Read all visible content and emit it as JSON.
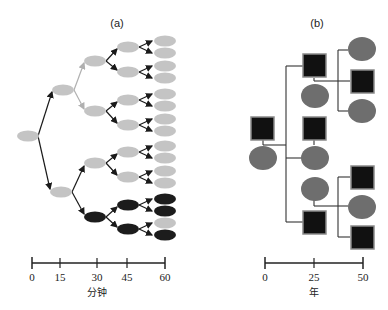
{
  "panel_a": {
    "label": "(a)",
    "axis": {
      "ticks": [
        "0",
        "15",
        "30",
        "45",
        "60"
      ],
      "unit": "分钟"
    },
    "colors": {
      "light": "#c4c4c4",
      "dark": "#1c1c1c",
      "arrow_dark": "#1a1a1a",
      "arrow_light": "#b0b0b0"
    },
    "nodes": [
      {
        "id": "r",
        "x": 28,
        "y": 136,
        "tone": "light"
      },
      {
        "id": "u",
        "x": 63,
        "y": 90,
        "tone": "light"
      },
      {
        "id": "l",
        "x": 61,
        "y": 192,
        "tone": "light"
      },
      {
        "id": "uu",
        "x": 95,
        "y": 61,
        "tone": "light"
      },
      {
        "id": "ul",
        "x": 95,
        "y": 111,
        "tone": "light"
      },
      {
        "id": "lu",
        "x": 95,
        "y": 163,
        "tone": "light"
      },
      {
        "id": "ll",
        "x": 95,
        "y": 217,
        "tone": "dark"
      },
      {
        "id": "uuu",
        "x": 128,
        "y": 47,
        "tone": "light"
      },
      {
        "id": "uul",
        "x": 128,
        "y": 72,
        "tone": "light"
      },
      {
        "id": "ulu",
        "x": 128,
        "y": 100,
        "tone": "light"
      },
      {
        "id": "ull",
        "x": 128,
        "y": 125,
        "tone": "light"
      },
      {
        "id": "luu",
        "x": 128,
        "y": 152,
        "tone": "light"
      },
      {
        "id": "lul",
        "x": 128,
        "y": 177,
        "tone": "light"
      },
      {
        "id": "llu",
        "x": 128,
        "y": 205,
        "tone": "dark"
      },
      {
        "id": "lll",
        "x": 128,
        "y": 229,
        "tone": "dark"
      }
    ],
    "leaves_tones": [
      "light",
      "light",
      "light",
      "light",
      "light",
      "light",
      "light",
      "light",
      "light",
      "light",
      "light",
      "light",
      "dark",
      "dark",
      "light",
      "dark"
    ]
  },
  "panel_b": {
    "label": "(b)",
    "axis": {
      "ticks": [
        "0",
        "25",
        "50"
      ],
      "unit": "年"
    },
    "colors": {
      "circle": "#6e6e6e",
      "square": "#111111",
      "square_border": "#8a8a8a",
      "line": "#333333"
    }
  }
}
